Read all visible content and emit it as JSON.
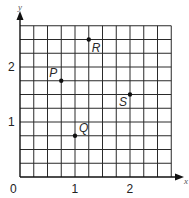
{
  "chart_data": {
    "type": "scatter",
    "title": "",
    "xlabel": "x",
    "ylabel": "y",
    "xlim": [
      0,
      2.75
    ],
    "ylim": [
      0,
      2.75
    ],
    "grid": true,
    "grid_step": 0.25,
    "x_ticks": [
      {
        "value": 0,
        "label": "0"
      },
      {
        "value": 1,
        "label": "1"
      },
      {
        "value": 2,
        "label": "2"
      }
    ],
    "y_ticks": [
      {
        "value": 1,
        "label": "1"
      },
      {
        "value": 2,
        "label": "2"
      }
    ],
    "points": [
      {
        "name": "P",
        "x": 0.75,
        "y": 1.75,
        "label_pos": "upper-left"
      },
      {
        "name": "Q",
        "x": 1.0,
        "y": 0.75,
        "label_pos": "upper-right"
      },
      {
        "name": "R",
        "x": 1.25,
        "y": 2.5,
        "label_pos": "lower-right"
      },
      {
        "name": "S",
        "x": 2.0,
        "y": 1.5,
        "label_pos": "lower-left"
      }
    ]
  },
  "labels": {
    "origin": "0",
    "x_axis": "x",
    "y_axis": "y"
  }
}
